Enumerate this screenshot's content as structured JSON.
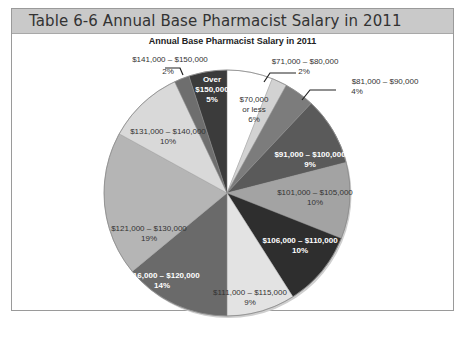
{
  "header": {
    "title": "Table 6-6  Annual Base Pharmacist Salary in 2011"
  },
  "chart_data": {
    "type": "pie",
    "title": "Annual Base Pharmacist Salary in 2011",
    "start_angle": "12 o'clock",
    "direction": "clockwise",
    "slices": [
      {
        "label": "$70,000 or less",
        "value": 6,
        "pct_label": "6%",
        "color": "#ffffff",
        "text_color": "#333333"
      },
      {
        "label": "$71,000 – $80,000",
        "value": 2,
        "pct_label": "2%",
        "color": "#d2d2d2",
        "text_color": "#333333"
      },
      {
        "label": "$81,000 – $90,000",
        "value": 4,
        "pct_label": "4%",
        "color": "#7c7c7c",
        "text_color": "#333333"
      },
      {
        "label": "$91,000 – $100,000",
        "value": 9,
        "pct_label": "9%",
        "color": "#5a5a5a",
        "text_color": "#ffffff"
      },
      {
        "label": "$101,000 – $105,000",
        "value": 10,
        "pct_label": "10%",
        "color": "#a3a3a3",
        "text_color": "#333333"
      },
      {
        "label": "$106,000 – $110,000",
        "value": 10,
        "pct_label": "10%",
        "color": "#2e2e2e",
        "text_color": "#ffffff"
      },
      {
        "label": "$111,000 – $115,000",
        "value": 9,
        "pct_label": "9%",
        "color": "#e3e3e3",
        "text_color": "#333333"
      },
      {
        "label": "$116,000 – $120,000",
        "value": 14,
        "pct_label": "14%",
        "color": "#6a6a6a",
        "text_color": "#ffffff"
      },
      {
        "label": "$121,000 – $130,000",
        "value": 19,
        "pct_label": "19%",
        "color": "#b5b5b5",
        "text_color": "#333333"
      },
      {
        "label": "$131,000 – $140,000",
        "value": 10,
        "pct_label": "10%",
        "color": "#d9d9d9",
        "text_color": "#333333"
      },
      {
        "label": "$141,000 – $150,000",
        "value": 2,
        "pct_label": "2%",
        "color": "#6e6e6e",
        "text_color": "#333333"
      },
      {
        "label": "Over $150,000",
        "value": 5,
        "pct_label": "5%",
        "color": "#3b3b3b",
        "text_color": "#ffffff"
      }
    ],
    "units": "% of pharmacists",
    "legend": "none (labels on/near slices)"
  }
}
